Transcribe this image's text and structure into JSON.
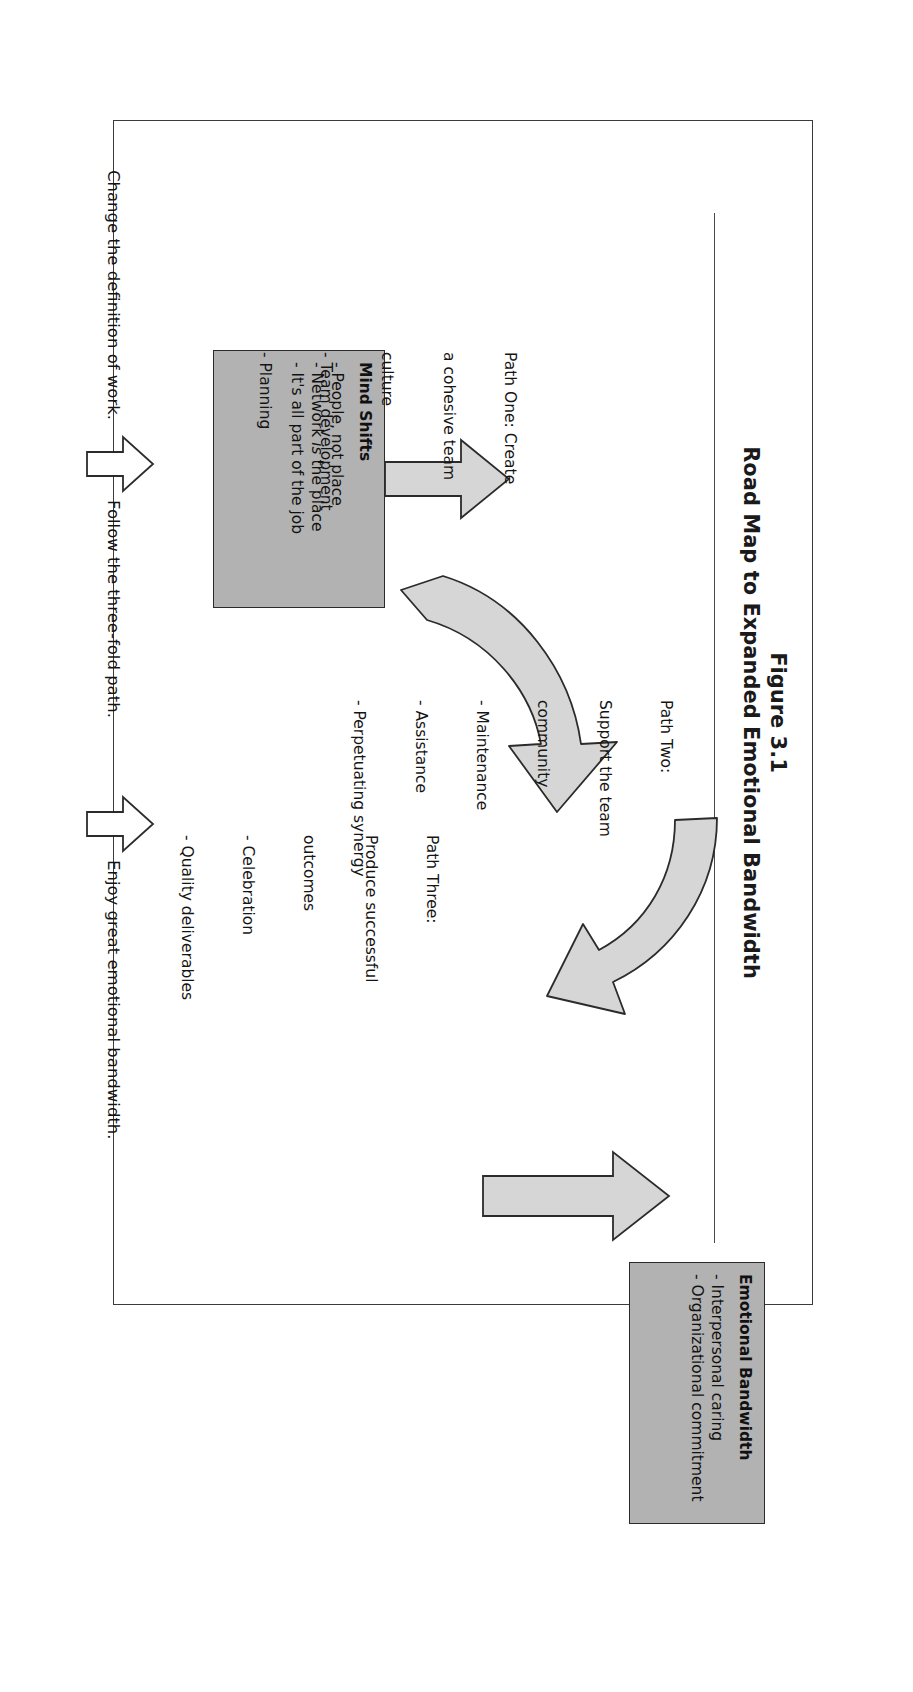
{
  "figure": {
    "number": "Figure 3.1",
    "title": "Road Map to Expanded Emotional Bandwidth"
  },
  "boxes": [
    {
      "id": "mind-shifts",
      "heading": "Mind Shifts",
      "bullets": [
        "- People, not place",
        "- Network is the place",
        "- It's all part of the job"
      ],
      "fill": "#b2b2b2"
    },
    {
      "id": "emotional-bandwidth",
      "heading": "Emotional Bandwidth",
      "bullets": [
        "- Interpersonal caring",
        "- Organizational commitment"
      ],
      "fill": "#b2b2b2"
    }
  ],
  "paths": [
    {
      "id": "path-one",
      "title_lines": [
        "Path One: Create",
        "a cohesive team",
        "culture"
      ],
      "bullets": [
        "- Team development",
        "- Planning"
      ]
    },
    {
      "id": "path-two",
      "title_lines": [
        "Path Two:",
        "Support the team",
        "community"
      ],
      "bullets": [
        "- Maintenance",
        "- Assistance",
        "- Perpetuating synergy"
      ]
    },
    {
      "id": "path-three",
      "title_lines": [
        "Path Three:",
        "Produce successful",
        "outcomes"
      ],
      "bullets": [
        "- Celebration",
        "- Quality deliverables"
      ]
    }
  ],
  "captions": [
    {
      "id": "caption-change",
      "text": "Change the definition of work."
    },
    {
      "id": "caption-follow",
      "text": "Follow the three-fold path."
    },
    {
      "id": "caption-enjoy",
      "text": "Enjoy great emotional bandwidth."
    }
  ],
  "colors": {
    "box_fill": "#b2b2b2",
    "arrow_fill": "#d6d6d6",
    "stroke": "#2b2b2b",
    "text": "#141414",
    "frame": "#3b3b3b"
  },
  "icons": {
    "arrow_up": "up-arrow-icon",
    "arrow_curve": "curved-arrow-icon",
    "arrow_outline": "outline-up-arrow-icon"
  }
}
